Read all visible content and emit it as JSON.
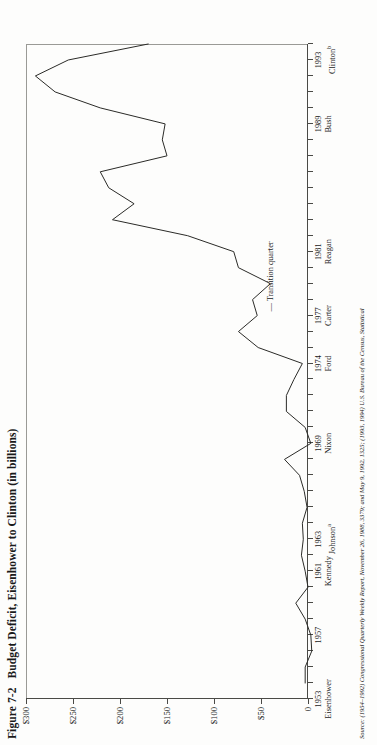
{
  "figure": {
    "number": "Figure 7-2",
    "title": "Budget Deficit, Eisenhower to Clinton (in billions)",
    "source_label": "Source:",
    "source_text": "(1954–1992) Congressional Quarterly Weekly Report, November 26, 1988, 3379; and May 9, 1992, 1325; (1993, 1994) U.S. Bureau of the Census, Statistical"
  },
  "annotations": [
    {
      "name": "transition-quarter",
      "text": "— Transition quarter"
    }
  ],
  "chart_data": {
    "type": "line",
    "title": "Budget Deficit, Eisenhower to Clinton (in billions)",
    "xlabel": "",
    "ylabel": "",
    "orientation": "rotated-90-ccw",
    "grid": false,
    "legend": false,
    "ylim": [
      0,
      300
    ],
    "ytick_labels": [
      "0",
      "$50",
      "$100",
      "$150",
      "$200",
      "$250",
      "$300"
    ],
    "ytick_values": [
      0,
      50,
      100,
      150,
      200,
      250,
      300
    ],
    "xlim": [
      1953,
      1994
    ],
    "xtick_years": [
      1953,
      1957,
      1961,
      1963,
      1969,
      1974,
      1977,
      1981,
      1989,
      1993
    ],
    "xtick_presidents": [
      {
        "year": "1953",
        "president": "Eisenhower",
        "note": ""
      },
      {
        "year": "1957",
        "president": "",
        "note": ""
      },
      {
        "year": "1961",
        "president": "Kennedy",
        "note": ""
      },
      {
        "year": "1963",
        "president": "Johnson",
        "note": "a"
      },
      {
        "year": "1969",
        "president": "Nixon",
        "note": ""
      },
      {
        "year": "1974",
        "president": "Ford",
        "note": ""
      },
      {
        "year": "1977",
        "president": "Carter",
        "note": ""
      },
      {
        "year": "1981",
        "president": "Reagan",
        "note": ""
      },
      {
        "year": "1989",
        "president": "Bush",
        "note": ""
      },
      {
        "year": "1993",
        "president": "Clinton",
        "note": "b"
      }
    ],
    "x": [
      1954,
      1955,
      1956,
      1957,
      1958,
      1959,
      1960,
      1961,
      1962,
      1963,
      1964,
      1965,
      1966,
      1967,
      1968,
      1969,
      1970,
      1971,
      1972,
      1973,
      1974,
      1975,
      1976,
      1977,
      1978,
      1979,
      1980,
      1981,
      1982,
      1983,
      1984,
      1985,
      1986,
      1987,
      1988,
      1989,
      1990,
      1991,
      1992,
      1993,
      1994
    ],
    "values": [
      3,
      3,
      -4,
      -3,
      3,
      13,
      0,
      3,
      7,
      5,
      6,
      1,
      4,
      9,
      25,
      -3,
      3,
      23,
      23,
      15,
      6,
      53,
      74,
      54,
      59,
      40,
      74,
      79,
      128,
      208,
      185,
      212,
      221,
      150,
      155,
      152,
      221,
      269,
      290,
      255,
      170
    ],
    "series": [
      {
        "name": "Budget deficit (in billions)",
        "values": [
          3,
          3,
          -4,
          -3,
          3,
          13,
          0,
          3,
          7,
          5,
          6,
          1,
          4,
          9,
          25,
          -3,
          3,
          23,
          23,
          15,
          6,
          53,
          74,
          54,
          59,
          40,
          74,
          79,
          128,
          208,
          185,
          212,
          221,
          150,
          155,
          152,
          221,
          269,
          290,
          255,
          170
        ]
      }
    ]
  }
}
